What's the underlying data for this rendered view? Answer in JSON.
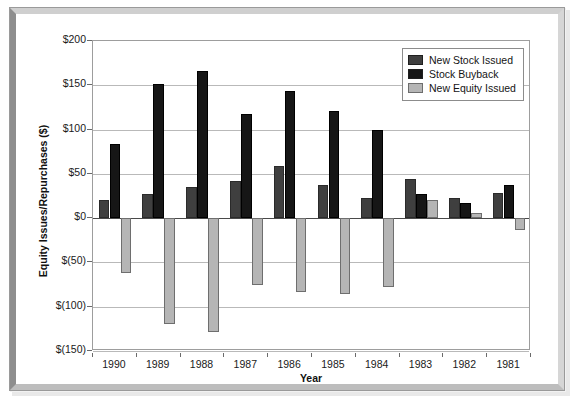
{
  "chart_data": {
    "type": "bar",
    "title": "",
    "xlabel": "Year",
    "ylabel": "Equity Issues/Repurchases ($)",
    "categories": [
      "1990",
      "1989",
      "1988",
      "1987",
      "1986",
      "1985",
      "1984",
      "1983",
      "1982",
      "1981"
    ],
    "ylim": [
      -150,
      200
    ],
    "yticks": [
      200,
      150,
      100,
      50,
      0,
      -50,
      -100,
      -150
    ],
    "ytick_labels": [
      "$200",
      "$150",
      "$100",
      "$50",
      "$0",
      "$(50)",
      "$(100)",
      "$(150)"
    ],
    "grid": true,
    "legend_position": "top-right",
    "series": [
      {
        "name": "New Stock Issued",
        "color": "#3f3f3f",
        "values": [
          20,
          27,
          35,
          42,
          59,
          37,
          23,
          44,
          23,
          28
        ]
      },
      {
        "name": "Stock Buyback",
        "color": "#161616",
        "values": [
          84,
          152,
          166,
          118,
          144,
          121,
          100,
          27,
          17,
          37
        ]
      },
      {
        "name": "New Equity Issued",
        "color": "#b5b5b5",
        "values": [
          -62,
          -119,
          -129,
          -76,
          -83,
          -86,
          -78,
          21,
          6,
          -13
        ]
      }
    ]
  },
  "legend": {
    "items": [
      {
        "label": "New Stock Issued",
        "color": "#3f3f3f"
      },
      {
        "label": "Stock Buyback",
        "color": "#161616"
      },
      {
        "label": "New Equity Issued",
        "color": "#b5b5b5"
      }
    ]
  },
  "axes": {
    "y_title": "Equity Issues/Repurchases ($)",
    "x_title": "Year"
  }
}
